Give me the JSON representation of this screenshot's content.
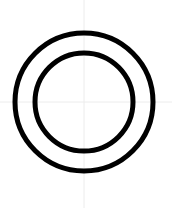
{
  "canvas": {
    "width": 172,
    "height": 208,
    "background_color": "#ffffff"
  },
  "figure": {
    "stroke_color": "#000000",
    "fill": "none"
  },
  "guides": {
    "color": "#ececec",
    "stroke_width": 1,
    "vertical": {
      "x": 84,
      "y1": 0,
      "y2": 208
    },
    "horizontal": {
      "y": 102,
      "x1": 0,
      "x2": 172
    }
  },
  "shapes": [
    {
      "name": "outer-circle",
      "type": "circle",
      "cx": 84,
      "cy": 102,
      "r": 69,
      "stroke": "#000000",
      "stroke_width": 5,
      "fill": "none"
    },
    {
      "name": "inner-circle",
      "type": "circle",
      "cx": 84,
      "cy": 102,
      "r": 49,
      "stroke": "#000000",
      "stroke_width": 5,
      "fill": "none"
    }
  ]
}
